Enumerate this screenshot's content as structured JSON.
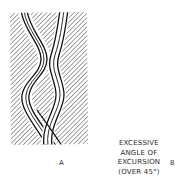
{
  "figure": {
    "panels": [
      {
        "id": "A",
        "label": "A",
        "description": "Wavy parallel-line vessels passing through a hatched region, crossing near the bottom"
      },
      {
        "id": "B",
        "label": "B",
        "description": "Three straight vertical lines beside a wavy pair of lines, with angle of excursion marked"
      }
    ],
    "annotation": {
      "lines": [
        "EXCESSIVE",
        "ANGLE OF",
        "EXCURSION",
        "(OVER 45°)"
      ]
    },
    "colors": {
      "ink": "#1a1a1a",
      "hatch": "#555555",
      "background": "#ffffff"
    }
  }
}
